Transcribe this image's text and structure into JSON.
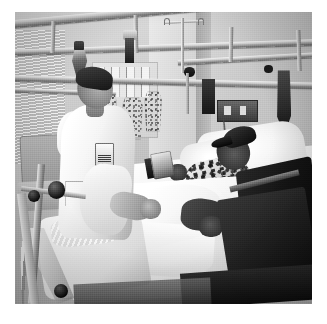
{
  "image": {
    "kind": "photograph",
    "treatment": "black-and-white",
    "alt_text": "Black and white photograph of a hospital room: a male nurse in a white uniform stands at the bedside of a patient lying in a hospital bed, with ceiling-mounted IV track rails overhead.",
    "border_color": "#ffffff",
    "frame": {
      "left": 15,
      "top": 12,
      "width": 297,
      "height": 292
    }
  },
  "scene": {
    "setting": "hospital patient room",
    "subjects": [
      {
        "name": "nurse",
        "description": "male healthcare worker in white short-sleeve uniform with clipped ID badge, standing at left bedside, leaning over the bed"
      },
      {
        "name": "patient",
        "description": "person lying in hospital bed wearing a dark cap and a patterned floral gown, head on white pillow"
      }
    ],
    "objects": [
      {
        "name": "ceiling-track-rails",
        "description": "overhead metal tracks spanning the room"
      },
      {
        "name": "iv-pole",
        "description": "IV stand with hooks at upper center-right"
      },
      {
        "name": "hanging-pouches",
        "description": "equipment pouches and bags suspended from the wall rail"
      },
      {
        "name": "wall-notes",
        "description": "papers and notes pinned to the back wall"
      },
      {
        "name": "power-outlet-panel",
        "description": "dark wall-mounted outlet and gas panel"
      },
      {
        "name": "bed-side-rail",
        "description": "dark hospital bed side rail on the right"
      },
      {
        "name": "traction-stand",
        "description": "chrome traction / equipment stand with knobs at lower left"
      },
      {
        "name": "bedding",
        "description": "white sheets and blankets covering the bed"
      },
      {
        "name": "chair",
        "description": "visitor chair in background at far left"
      },
      {
        "name": "window-blinds",
        "description": "venetian blinds on the left wall"
      }
    ],
    "palette": {
      "highlight": "#fdfdfd",
      "light_gray": "#dedede",
      "mid_gray": "#a9a9a9",
      "dark_gray": "#4a4a4a",
      "shadow": "#111111"
    }
  },
  "caption": {
    "text": ""
  }
}
